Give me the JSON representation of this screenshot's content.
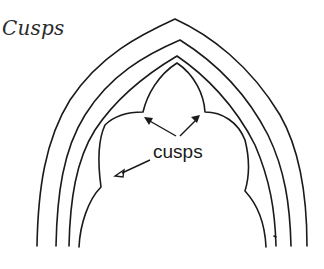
{
  "title": "Cusps",
  "diagram": {
    "arch_count": 4,
    "label": "cusps",
    "arrows": [
      {
        "target": "upper-left cusp"
      },
      {
        "target": "upper-right cusp"
      },
      {
        "target": "lower-left cusp"
      }
    ],
    "stroke_color": "#1a1a1a",
    "background_color": "#ffffff"
  }
}
